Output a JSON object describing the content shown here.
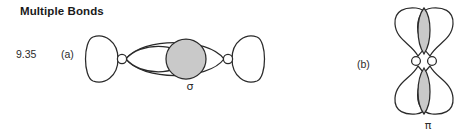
{
  "page": {
    "background_color": "#ffffff",
    "heading": "Multiple Bonds",
    "problem_number": "9.35"
  },
  "colors": {
    "outline": "#2a2a2a",
    "lobe_fill": "#ffffff",
    "overlap_shade": "#c9c9c9",
    "text": "#2b2b2b"
  },
  "parts": {
    "a": {
      "label": "(a)",
      "bond_symbol": "σ",
      "bond_name": "sigma-bond",
      "description": "End-on overlap of orbitals along the internuclear axis with shaded overlap region between the two nuclei"
    },
    "b": {
      "label": "(b)",
      "bond_symbol": "π",
      "bond_name": "pi-bond",
      "description": "Side-on overlap of two p orbitals above and below the internuclear axis with shaded overlap lobes"
    }
  }
}
